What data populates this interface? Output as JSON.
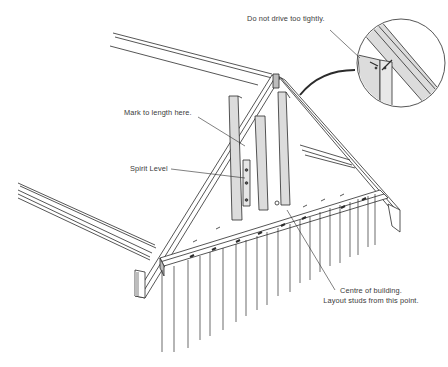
{
  "figure": {
    "colors": {
      "ink": "#2b2b2b",
      "timber_fill": "#dcdcdc",
      "background": "#ffffff"
    }
  },
  "callouts": {
    "do_not_drive": "Do not drive too tightly.",
    "mark_to_length": "Mark to length here.",
    "spirit_level": "Spirit Level",
    "centre_line1": "Centre of building.",
    "centre_line2": "Layout studs from this point."
  },
  "inset": {
    "shape": "circle",
    "content": "Detail of nailed stud to rafter joint"
  }
}
